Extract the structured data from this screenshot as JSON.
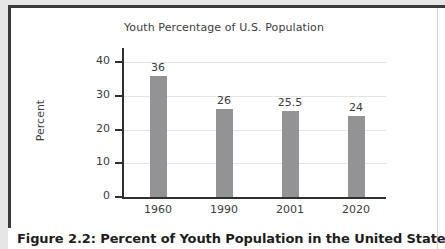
{
  "figure": {
    "caption": "Figure 2.2: Percent of Youth Population in the United States"
  },
  "chart_data": {
    "type": "bar",
    "title": "Youth Percentage of U.S. Population",
    "xlabel": "",
    "ylabel": "Percent",
    "categories": [
      "1960",
      "1990",
      "2001",
      "2020"
    ],
    "values": [
      36,
      26,
      25.5,
      24
    ],
    "value_labels": [
      "36",
      "26",
      "25.5",
      "24"
    ],
    "ylim": [
      0,
      40
    ],
    "yticks": [
      0,
      10,
      20,
      30,
      40
    ],
    "ytick_labels": [
      "0",
      "10",
      "20",
      "30",
      "40"
    ],
    "grid": true,
    "legend": "none",
    "bar_color": "#939395",
    "axis_color": "#2f2f31",
    "grid_color": "#e4e4e4",
    "text_color": "#3c3c3e"
  }
}
